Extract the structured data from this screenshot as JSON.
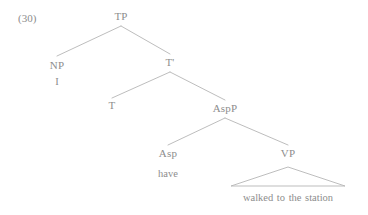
{
  "figure": {
    "example_number": "(30)",
    "line_color": "#b5b5b5",
    "text_color": "#8d8d8d",
    "background": "#ffffff"
  },
  "tree": {
    "nodes": {
      "tp": {
        "label": "TP",
        "x": 121,
        "y": 16
      },
      "np": {
        "label": "NP",
        "x": 57,
        "y": 65
      },
      "np_terminal": {
        "label": "I",
        "x": 57,
        "y": 82
      },
      "tbar": {
        "label": "T'",
        "x": 170,
        "y": 62
      },
      "t": {
        "label": "T",
        "x": 112,
        "y": 105
      },
      "aspp": {
        "label": "AspP",
        "x": 225,
        "y": 108
      },
      "asp": {
        "label": "Asp",
        "x": 168,
        "y": 153
      },
      "asp_terminal": {
        "label": "have",
        "x": 168,
        "y": 174
      },
      "vp": {
        "label": "VP",
        "x": 288,
        "y": 153
      },
      "vp_phrase": {
        "label": "walked to the station",
        "x": 288,
        "y": 198
      }
    },
    "edges": [
      {
        "name": "tp-to-np",
        "x1": 121,
        "y1": 26,
        "x2": 57,
        "y2": 56
      },
      {
        "name": "tp-to-tbar",
        "x1": 121,
        "y1": 26,
        "x2": 170,
        "y2": 54
      },
      {
        "name": "tbar-to-t",
        "x1": 170,
        "y1": 72,
        "x2": 112,
        "y2": 98
      },
      {
        "name": "tbar-to-aspp",
        "x1": 170,
        "y1": 72,
        "x2": 225,
        "y2": 100
      },
      {
        "name": "aspp-to-asp",
        "x1": 225,
        "y1": 118,
        "x2": 168,
        "y2": 145
      },
      {
        "name": "aspp-to-vp",
        "x1": 225,
        "y1": 118,
        "x2": 288,
        "y2": 145
      }
    ],
    "triangle": {
      "name": "vp-triangle",
      "apex_x": 288,
      "apex_y": 167,
      "left_x": 231,
      "left_y": 186,
      "right_x": 345,
      "right_y": 186
    }
  }
}
